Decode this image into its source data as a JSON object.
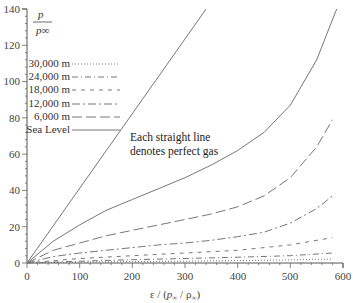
{
  "chart_data": {
    "type": "line",
    "title": "",
    "xlabel": "ε / (p∞ / ρ∞)",
    "ylabel": "p / p∞",
    "xlim": [
      0,
      600
    ],
    "ylim": [
      0,
      140
    ],
    "x_ticks": [
      0,
      100,
      200,
      300,
      400,
      500,
      600
    ],
    "y_ticks": [
      0,
      20,
      40,
      60,
      80,
      100,
      120,
      140
    ],
    "grid": false,
    "legend_position": "upper-left",
    "annotation": [
      "Each straight line",
      "denotes perfect gas"
    ],
    "series": [
      {
        "name": "Perfect gas (straight line)",
        "style": "solid",
        "x": [
          0,
          340
        ],
        "y": [
          0,
          140
        ]
      },
      {
        "name": "Sea Level",
        "style": "solid",
        "x": [
          0,
          50,
          100,
          150,
          200,
          250,
          300,
          350,
          400,
          450,
          500,
          550,
          588
        ],
        "y": [
          0,
          12,
          21,
          29,
          35,
          41,
          47,
          54,
          62,
          72,
          87,
          112,
          140
        ]
      },
      {
        "name": "6,000 m",
        "style": "long-dash",
        "x": [
          0,
          50,
          100,
          150,
          200,
          250,
          300,
          350,
          400,
          450,
          500,
          550,
          580
        ],
        "y": [
          0,
          7,
          11,
          15,
          18,
          21,
          24,
          27,
          31,
          37,
          47,
          64,
          79
        ]
      },
      {
        "name": "12,000 m",
        "style": "dash-dot",
        "x": [
          0,
          50,
          100,
          150,
          200,
          250,
          300,
          350,
          400,
          450,
          500,
          550,
          580
        ],
        "y": [
          0,
          3.5,
          5.5,
          7,
          8.5,
          10,
          11,
          12.5,
          14.5,
          17,
          22,
          30,
          37
        ]
      },
      {
        "name": "18,000 m",
        "style": "short-dash",
        "x": [
          0,
          100,
          200,
          300,
          400,
          500,
          580
        ],
        "y": [
          0,
          2.5,
          4,
          5.5,
          7,
          10,
          14
        ]
      },
      {
        "name": "24,000 m",
        "style": "dash-dot-dot",
        "x": [
          0,
          100,
          200,
          300,
          400,
          500,
          580
        ],
        "y": [
          0,
          1,
          1.8,
          2.5,
          3.2,
          4,
          5.5
        ]
      },
      {
        "name": "30,000 m",
        "style": "dotted",
        "x": [
          0,
          100,
          200,
          300,
          400,
          500,
          580
        ],
        "y": [
          0,
          0.5,
          0.8,
          1,
          1.3,
          1.7,
          2.2
        ]
      }
    ]
  },
  "legend": {
    "items": [
      "30,000 m",
      "24,000 m",
      "18,000 m",
      "12,000 m",
      "6,000 m",
      "Sea Level"
    ]
  },
  "ylabel": {
    "num": "p",
    "den": "p∞"
  },
  "xlabel": {
    "eps": "ε / (",
    "p": "p",
    "sub1": "∞",
    "slash": " / ",
    "rho": "ρ",
    "sub2": "∞",
    "close": ")"
  },
  "annotation": {
    "line1": "Each straight line",
    "line2": "denotes perfect gas"
  },
  "ticks": {
    "x": [
      "0",
      "100",
      "200",
      "300",
      "400",
      "500",
      "600"
    ],
    "y": [
      "0",
      "20",
      "40",
      "60",
      "80",
      "100",
      "120",
      "140"
    ]
  }
}
